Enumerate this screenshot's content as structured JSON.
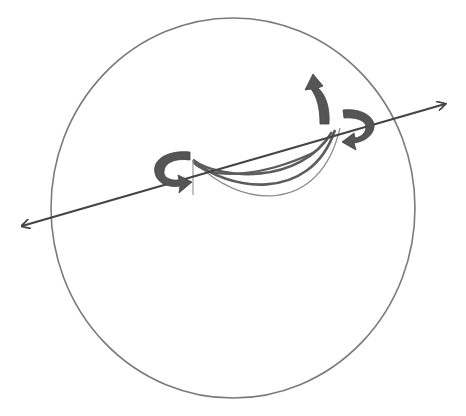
{
  "diagram": {
    "type": "sphere-rotation-axis",
    "colors": {
      "background": "#ffffff",
      "sphere_outline": "#777777",
      "axis": "#444444",
      "rotation_arrow": "#555555",
      "arc_dark": "#5a5a5a",
      "arc_light": "#9a9a9a"
    },
    "sphere": {
      "cx": 233,
      "cy": 208,
      "rx": 182,
      "ry": 190
    },
    "axis": {
      "x1": 20,
      "y1": 227,
      "x2": 447,
      "y2": 103
    },
    "rotation_arrows": [
      "left-curved-arrow",
      "right-curved-arrow",
      "up-curved-arrow"
    ],
    "arcs": 4
  }
}
